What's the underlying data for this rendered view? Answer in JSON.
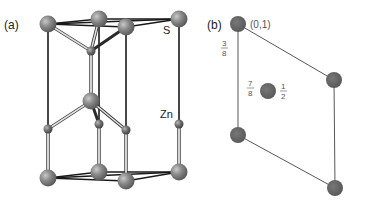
{
  "figure": {
    "panel_a": {
      "label": "(a)",
      "atom_labels": {
        "sulfur": "S",
        "zinc": "Zn"
      }
    },
    "panel_b": {
      "label": "(b)",
      "corner_coord": "(0,1)",
      "fractions": {
        "left_top": {
          "num": "3",
          "den": "8"
        },
        "center_left": {
          "num": "7",
          "den": "8"
        },
        "center_right": {
          "num": "1",
          "den": "2"
        }
      }
    },
    "colors": {
      "sulfur": "#7d7d7d",
      "zinc": "#6a6a6a",
      "bond_dark": "#1a1a1a",
      "bond_light": "#bdbdbd",
      "projection_atom": "#5f5f5f",
      "projection_line": "#444444"
    }
  }
}
